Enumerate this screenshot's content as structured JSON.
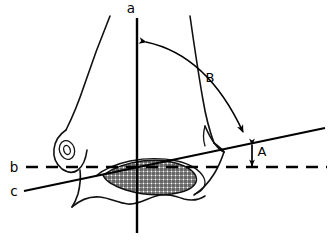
{
  "figure": {
    "background_color": "#ffffff",
    "ink_color": "#000000",
    "width": 329,
    "height": 242
  },
  "labels": {
    "axis_a": "a",
    "axis_b": "b",
    "axis_c": "c",
    "angle_A": "A",
    "angle_B": "B"
  },
  "reference_lines": [
    {
      "id": "a",
      "label": "a",
      "style": "solid",
      "orientation": "vertical",
      "description": "vertical anatomical axis line"
    },
    {
      "id": "b",
      "label": "b",
      "style": "dashed",
      "orientation": "horizontal",
      "description": "horizontal dashed reference line"
    },
    {
      "id": "c",
      "label": "c",
      "style": "solid",
      "orientation": "oblique",
      "description": "oblique tibial plafond reference line"
    }
  ],
  "measurements": [
    {
      "id": "A",
      "label": "A",
      "type": "linear-distance",
      "marker": "double-headed-arrow",
      "between": [
        "c",
        "b"
      ]
    },
    {
      "id": "B",
      "label": "B",
      "type": "angle",
      "marker": "curved-double-arrow",
      "between": [
        "a",
        "c"
      ]
    }
  ],
  "shapes": {
    "stipple_region": "cross-hatched articular surface region",
    "malleolus_detail": "small oval inclusion in medial malleolus"
  }
}
